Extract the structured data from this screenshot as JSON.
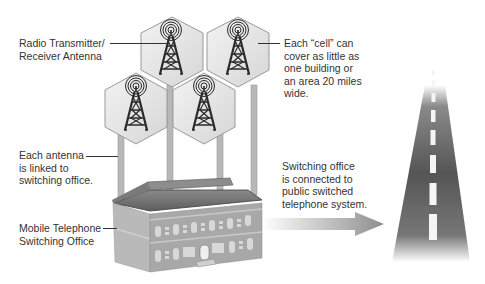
{
  "diagram": {
    "labels": {
      "antenna": "Radio Transmitter/\nReceiver Antenna",
      "cell": "Each “cell” can\ncover as little as\none building or\nan area 20 miles\nwide.",
      "linked": "Each antenna\nis linked to\nswitching office.",
      "office": "Mobile Telephone\nSwitching Office",
      "switching": "Switching office\nis connected to\npublic switched\ntelephone system."
    },
    "icons": {
      "cell": "hexagon-cell-icon",
      "tower": "radio-tower-icon",
      "building": "switching-office-building-icon",
      "arrow": "right-arrow-icon",
      "road": "highway-icon"
    },
    "colors": {
      "hex_fill": "#e2e2e2",
      "hex_stroke": "#9a9a9a",
      "tower": "#2b2b2b",
      "pole": "#b5b5b5",
      "roof": "#6e6e6e",
      "wall": "#a9a9a9",
      "road": "#555555",
      "arrow": "#9a9a9a"
    }
  }
}
